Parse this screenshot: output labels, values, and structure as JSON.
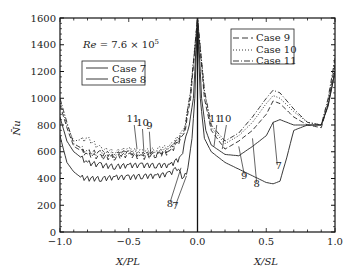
{
  "chart_data": {
    "type": "line",
    "title": "",
    "annotation": "Re = 7.6 × 10^5",
    "annotation_parts": {
      "re": "Re",
      "eq": " = 7.6 × 10",
      "exp": "5"
    },
    "ylabel": "Nu (overbar)",
    "ylabel_display": "N̄u",
    "xlabel_left": "X/PL",
    "xlabel_right": "X/SL",
    "ylim": [
      0,
      1600
    ],
    "xlim": [
      -1.0,
      1.0
    ],
    "y_ticks": [
      0,
      200,
      400,
      600,
      800,
      1000,
      1200,
      1400,
      1600
    ],
    "y_tick_labels": [
      "0",
      "200",
      "400",
      "600",
      "800",
      "1000",
      "1200",
      "1400",
      "1600"
    ],
    "x_ticks": [
      -1.0,
      -0.5,
      0.0,
      0.5,
      1.0
    ],
    "x_tick_labels": [
      "−1.0",
      "−0.5",
      "0.0",
      "0.5",
      "1.0"
    ],
    "grid": false,
    "legends": [
      {
        "position": "upper-left",
        "entries": [
          {
            "label": "Case 7",
            "style": "solid"
          },
          {
            "label": "Case 8",
            "style": "solid"
          }
        ]
      },
      {
        "position": "upper-right",
        "entries": [
          {
            "label": "Case 9",
            "style": "dashed"
          },
          {
            "label": "Case 10",
            "style": "dotted"
          },
          {
            "label": "Case 11",
            "style": "dash-dot"
          }
        ]
      }
    ],
    "curve_labels_left": [
      {
        "text": "11",
        "x": -0.47,
        "y": 820
      },
      {
        "text": "10",
        "x": -0.4,
        "y": 790
      },
      {
        "text": "9",
        "x": -0.35,
        "y": 770
      },
      {
        "text": "8",
        "x": -0.2,
        "y": 190
      },
      {
        "text": "7",
        "x": -0.16,
        "y": 170
      }
    ],
    "curve_labels_right": [
      {
        "text": "11",
        "x": 0.13,
        "y": 820
      },
      {
        "text": "10",
        "x": 0.2,
        "y": 820
      },
      {
        "text": "9",
        "x": 0.34,
        "y": 400
      },
      {
        "text": "8",
        "x": 0.43,
        "y": 340
      },
      {
        "text": "7",
        "x": 0.59,
        "y": 470
      }
    ],
    "series": [
      {
        "name": "Case 7",
        "style": "solid",
        "x": [
          -1.0,
          -0.95,
          -0.9,
          -0.85,
          -0.8,
          -0.7,
          -0.6,
          -0.5,
          -0.4,
          -0.3,
          -0.2,
          -0.15,
          -0.1,
          -0.07,
          -0.04,
          -0.02,
          0.0,
          0.02,
          0.05,
          0.1,
          0.2,
          0.3,
          0.4,
          0.5,
          0.55,
          0.6,
          0.65,
          0.7,
          0.8,
          0.9,
          0.95,
          1.0
        ],
        "y": [
          720,
          520,
          450,
          410,
          400,
          400,
          410,
          410,
          420,
          420,
          440,
          480,
          400,
          480,
          700,
          1000,
          1600,
          1000,
          700,
          600,
          520,
          470,
          420,
          370,
          360,
          380,
          560,
          760,
          800,
          800,
          940,
          1200
        ]
      },
      {
        "name": "Case 8",
        "style": "solid",
        "x": [
          -1.0,
          -0.95,
          -0.9,
          -0.8,
          -0.7,
          -0.6,
          -0.5,
          -0.4,
          -0.3,
          -0.2,
          -0.12,
          -0.06,
          -0.03,
          0.0,
          0.03,
          0.06,
          0.1,
          0.2,
          0.3,
          0.4,
          0.5,
          0.55,
          0.6,
          0.7,
          0.8,
          0.9,
          0.95,
          1.0
        ],
        "y": [
          860,
          680,
          600,
          520,
          500,
          490,
          500,
          500,
          500,
          500,
          560,
          800,
          1000,
          1600,
          1000,
          760,
          650,
          580,
          570,
          640,
          720,
          820,
          840,
          800,
          800,
          800,
          950,
          1200
        ]
      },
      {
        "name": "Case 9",
        "style": "dashed",
        "x": [
          -1.0,
          -0.95,
          -0.9,
          -0.8,
          -0.7,
          -0.6,
          -0.5,
          -0.4,
          -0.3,
          -0.2,
          -0.1,
          -0.05,
          0.0,
          0.05,
          0.1,
          0.2,
          0.3,
          0.4,
          0.5,
          0.55,
          0.6,
          0.7,
          0.8,
          0.9,
          0.95,
          1.0
        ],
        "y": [
          950,
          780,
          640,
          580,
          560,
          560,
          580,
          560,
          580,
          600,
          720,
          1000,
          1600,
          1000,
          760,
          620,
          680,
          760,
          880,
          980,
          960,
          860,
          800,
          780,
          960,
          1250
        ]
      },
      {
        "name": "Case 10",
        "style": "dotted",
        "x": [
          -1.0,
          -0.95,
          -0.9,
          -0.8,
          -0.7,
          -0.6,
          -0.5,
          -0.4,
          -0.3,
          -0.2,
          -0.1,
          -0.05,
          0.0,
          0.05,
          0.1,
          0.2,
          0.3,
          0.4,
          0.5,
          0.55,
          0.6,
          0.7,
          0.8,
          0.9,
          0.95,
          1.0
        ],
        "y": [
          980,
          800,
          680,
          700,
          620,
          600,
          620,
          600,
          620,
          640,
          760,
          1050,
          1600,
          1050,
          780,
          660,
          720,
          820,
          960,
          1020,
          1000,
          900,
          820,
          800,
          980,
          1280
        ]
      },
      {
        "name": "Case 11",
        "style": "dash-dot",
        "x": [
          -1.0,
          -0.95,
          -0.9,
          -0.8,
          -0.7,
          -0.6,
          -0.5,
          -0.4,
          -0.3,
          -0.2,
          -0.1,
          -0.05,
          0.0,
          0.05,
          0.1,
          0.2,
          0.3,
          0.4,
          0.5,
          0.55,
          0.6,
          0.7,
          0.8,
          0.9,
          0.95,
          1.0
        ],
        "y": [
          1000,
          820,
          660,
          600,
          590,
          580,
          600,
          580,
          590,
          620,
          740,
          1050,
          1600,
          1060,
          800,
          680,
          740,
          860,
          1000,
          1060,
          1040,
          920,
          820,
          800,
          1000,
          1300
        ]
      }
    ]
  }
}
